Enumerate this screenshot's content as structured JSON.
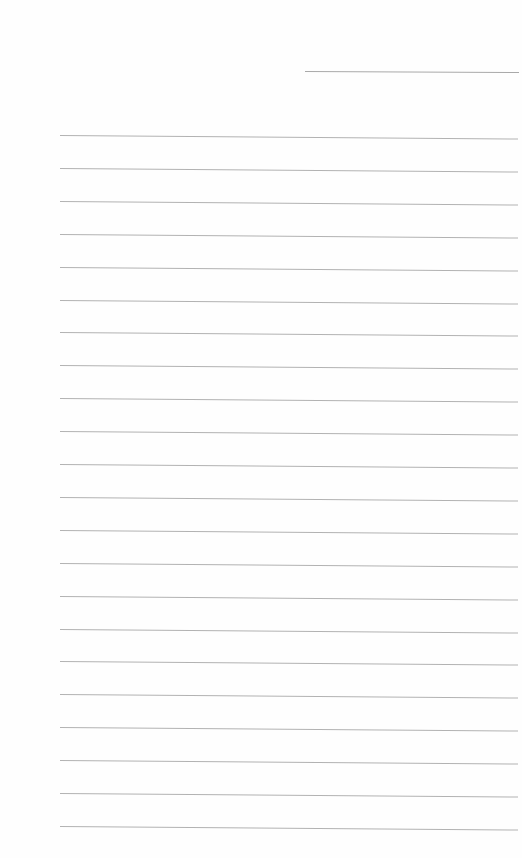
{
  "page": {
    "type": "blank lined paper",
    "background": "#fefefe",
    "line_color": "#b2b2b2",
    "header_line": {
      "x_start": 305,
      "x_end": 519,
      "y": 71
    },
    "ruled_lines": {
      "count": 22,
      "x_start": 60,
      "x_end": 518,
      "y_first": 135,
      "spacing": 32.9
    }
  }
}
